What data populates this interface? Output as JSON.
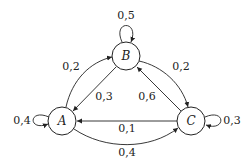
{
  "diagram": {
    "type": "markov-chain",
    "nodes": [
      {
        "id": "A",
        "label": "A"
      },
      {
        "id": "B",
        "label": "B"
      },
      {
        "id": "C",
        "label": "C"
      }
    ],
    "edges": [
      {
        "from": "A",
        "to": "A",
        "label": "0,4"
      },
      {
        "from": "A",
        "to": "B",
        "label": "0,2"
      },
      {
        "from": "A",
        "to": "C",
        "label": "0,4"
      },
      {
        "from": "B",
        "to": "B",
        "label": "0,5"
      },
      {
        "from": "B",
        "to": "A",
        "label": "0,3"
      },
      {
        "from": "B",
        "to": "C",
        "label": "0,2"
      },
      {
        "from": "C",
        "to": "C",
        "label": "0,3"
      },
      {
        "from": "C",
        "to": "A",
        "label": "0,1"
      },
      {
        "from": "C",
        "to": "B",
        "label": "0,6"
      }
    ]
  }
}
